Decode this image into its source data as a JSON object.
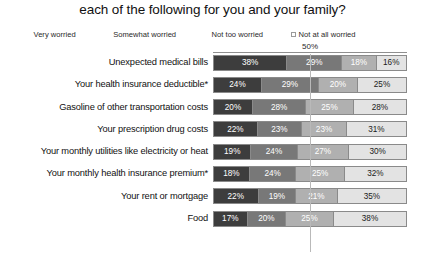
{
  "chart_data": {
    "type": "bar",
    "subtype": "stacked-horizontal-100",
    "title": "each of the following for you and your family?",
    "xlabel": "",
    "ylabel": "",
    "xlim": [
      0,
      100
    ],
    "grid": true,
    "gridlines": [
      "50%"
    ],
    "legend_position": "top",
    "categories": [
      "Unexpected medical bills",
      "Your health insurance deductible*",
      "Gasoline of other transportation costs",
      "Your prescription drug costs",
      "Your monthly utilities like electricity or heat",
      "Your monthly health insurance premium*",
      "Your rent or mortgage",
      "Food"
    ],
    "series": [
      {
        "name": "Very worried",
        "color": "#3d3d3d",
        "values": [
          38,
          24,
          20,
          22,
          19,
          18,
          22,
          17
        ],
        "labels": [
          "38%",
          "24%",
          "20%",
          "22%",
          "19%",
          "18%",
          "22%",
          "17%"
        ]
      },
      {
        "name": "Somewhat worried",
        "color": "#787878",
        "values": [
          29,
          29,
          28,
          23,
          24,
          24,
          19,
          20
        ],
        "labels": [
          "29%",
          "29%",
          "28%",
          "23%",
          "24%",
          "24%",
          "19%",
          "20%"
        ]
      },
      {
        "name": "Not too worried",
        "color": "#b0b0b0",
        "values": [
          18,
          20,
          25,
          23,
          27,
          25,
          21,
          25
        ],
        "labels": [
          "18%",
          "20%",
          "25%",
          "23%",
          "27%",
          "25%",
          "21%",
          "25%"
        ]
      },
      {
        "name": "Not at all worried",
        "color": "#e3e3e3",
        "values": [
          16,
          25,
          28,
          31,
          30,
          32,
          35,
          38
        ],
        "labels": [
          "16%",
          "25%",
          "28%",
          "31%",
          "30%",
          "32%",
          "35%",
          "38%"
        ]
      }
    ],
    "axis_ticks": [
      {
        "label": "50%",
        "value": 50
      }
    ]
  }
}
